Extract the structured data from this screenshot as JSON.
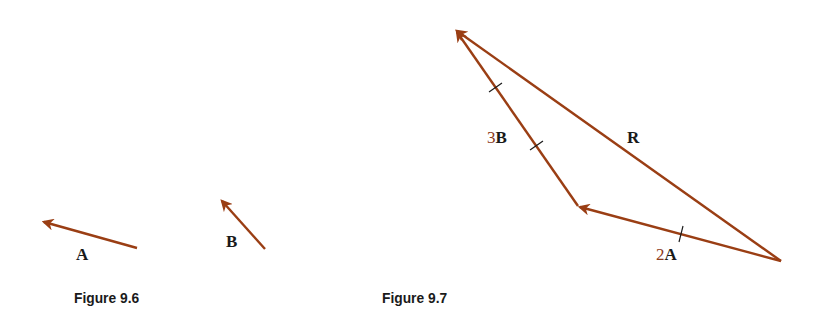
{
  "figures": [
    {
      "caption": "Figure 9.6",
      "vectors": [
        {
          "label": "A",
          "from": [
            137,
            248
          ],
          "to": [
            42,
            221
          ]
        },
        {
          "label": "B",
          "from": [
            265,
            249
          ],
          "to": [
            220,
            199
          ]
        }
      ]
    },
    {
      "caption": "Figure 9.7",
      "vectors": [
        {
          "label_coef": "2",
          "label": "A",
          "from": [
            781,
            261
          ],
          "to": [
            578,
            206
          ],
          "ticks": 1
        },
        {
          "label_coef": "3",
          "label": "B",
          "from": [
            578,
            206
          ],
          "to": [
            455,
            30
          ],
          "ticks": 2
        },
        {
          "label": "R",
          "from": [
            781,
            261
          ],
          "to": [
            455,
            30
          ]
        }
      ]
    }
  ],
  "colors": {
    "vector": "#9a3e14",
    "tick": "#1a1a1a",
    "text": "#1a1a1a",
    "coefficient": "#8b3a1a"
  }
}
